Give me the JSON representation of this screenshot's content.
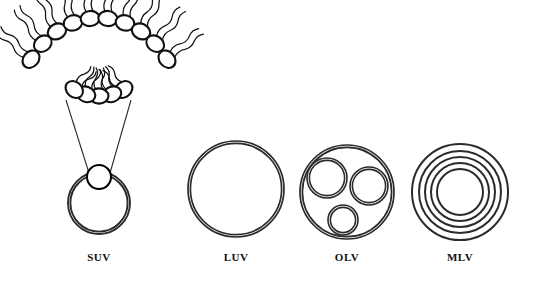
{
  "figure": {
    "background_color": "#ffffff",
    "stroke_color": "#2b2b2b",
    "head_stroke_color": "#111111"
  },
  "bilayer_inset": {
    "name": "phospholipid-bilayer",
    "top_leaflet_head_count": 10,
    "bottom_leaflet_head_count": 5,
    "head_shape": "ellipse",
    "tail_style": "wavy-double"
  },
  "vesicles": [
    {
      "id": "suv",
      "label": "SUV",
      "full_name": "Small Unilamellar Vesicle",
      "lamellae": 1,
      "inner_vesicles": 0,
      "cx": 99,
      "cy": 203,
      "r": 31,
      "label_x": 99,
      "label_y": 261
    },
    {
      "id": "luv",
      "label": "LUV",
      "full_name": "Large Unilamellar Vesicle",
      "lamellae": 1,
      "inner_vesicles": 0,
      "cx": 236,
      "cy": 189,
      "r": 48,
      "label_x": 236,
      "label_y": 261
    },
    {
      "id": "olv",
      "label": "OLV",
      "full_name": "Oligolamellar Vesicle",
      "lamellae": 1,
      "inner_vesicles": 3,
      "cx": 347,
      "cy": 192,
      "r": 47,
      "label_x": 347,
      "label_y": 261
    },
    {
      "id": "mlv",
      "label": "MLV",
      "full_name": "Multilamellar Vesicle",
      "lamellae": 5,
      "inner_vesicles": 0,
      "cx": 460,
      "cy": 192,
      "r": 48,
      "label_x": 460,
      "label_y": 261
    }
  ],
  "olv_inner_vesicles": [
    {
      "name": "olv-inner-vesicle-upper-left",
      "cx": 327,
      "cy": 178,
      "r": 20
    },
    {
      "name": "olv-inner-vesicle-upper-right",
      "cx": 369,
      "cy": 186,
      "r": 19
    },
    {
      "name": "olv-inner-vesicle-lower",
      "cx": 343,
      "cy": 220,
      "r": 15
    }
  ],
  "mlv_rings": [
    48,
    41,
    35,
    29,
    23
  ],
  "suv_detail": {
    "magnifier_circle": {
      "name": "suv-bilayer-magnifier",
      "cx": 99,
      "cy": 177,
      "r": 12
    },
    "leader_line_left": {
      "x1": 66,
      "y1": 100,
      "x2": 89,
      "y2": 173
    },
    "leader_line_right": {
      "x1": 131,
      "y1": 100,
      "x2": 110,
      "y2": 173
    }
  }
}
